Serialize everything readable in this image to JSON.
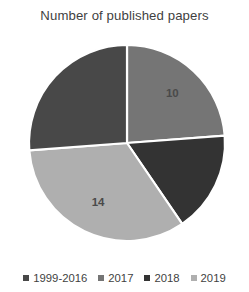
{
  "chart_data": {
    "type": "pie",
    "title": "Number of published papers",
    "categories": [
      "1999-2016",
      "2017",
      "2018",
      "2019"
    ],
    "values": [
      11,
      10,
      7,
      14
    ],
    "data_labels": [
      "",
      "10",
      "",
      "14"
    ],
    "colors": [
      "#484848",
      "#757575",
      "#333333",
      "#afafaf"
    ],
    "start_angle_deg": 0,
    "direction": "clockwise",
    "legend": {
      "position": "bottom",
      "entries": [
        {
          "label": "1999-2016",
          "color": "#484848"
        },
        {
          "label": "2017",
          "color": "#757575"
        },
        {
          "label": "2018",
          "color": "#333333"
        },
        {
          "label": "2019",
          "color": "#afafaf"
        }
      ]
    },
    "geometry": {
      "center_x": 127,
      "center_y": 115,
      "radius": 98
    },
    "grid": false,
    "xlabel": "",
    "ylabel": ""
  }
}
